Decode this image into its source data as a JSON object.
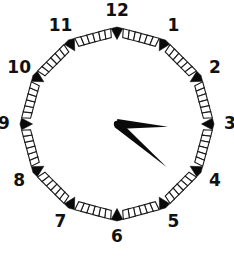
{
  "widget": {
    "type": "analog-clock",
    "title": "Analog clock face",
    "background_color": "#ffffff",
    "ink_color": "#0a0a0a",
    "dial_shape": "dodecagon",
    "dial_style": "segmented-ladder-ring",
    "marker_style": "solid-triangle-arrowhead"
  },
  "dial": {
    "center_x": 117,
    "center_y": 124,
    "radius": 97,
    "ring_thickness": 9,
    "number_radius": 113,
    "segments_per_side": 6,
    "hour_numbers": [
      {
        "label": "12",
        "hour": 12,
        "angle_deg": 0
      },
      {
        "label": "1",
        "hour": 1,
        "angle_deg": 30
      },
      {
        "label": "2",
        "hour": 2,
        "angle_deg": 60
      },
      {
        "label": "3",
        "hour": 3,
        "angle_deg": 90
      },
      {
        "label": "4",
        "hour": 4,
        "angle_deg": 120
      },
      {
        "label": "5",
        "hour": 5,
        "angle_deg": 150
      },
      {
        "label": "6",
        "hour": 6,
        "angle_deg": 180
      },
      {
        "label": "7",
        "hour": 7,
        "angle_deg": 210
      },
      {
        "label": "8",
        "hour": 8,
        "angle_deg": 240
      },
      {
        "label": "9",
        "hour": 9,
        "angle_deg": 270
      },
      {
        "label": "10",
        "hour": 10,
        "angle_deg": 300
      },
      {
        "label": "11",
        "hour": 11,
        "angle_deg": 330
      }
    ]
  },
  "hands": {
    "hour": {
      "name": "hour-hand",
      "angle_deg": 131,
      "length": 66,
      "base_half_width": 4,
      "points_toward": "between 4 and 5"
    },
    "minute": {
      "name": "minute-hand",
      "angle_deg": 93,
      "length": 51,
      "base_half_width": 5,
      "points_toward": "3"
    },
    "pivot_radius": 3.2
  },
  "time": {
    "hour": 4,
    "minute": 16,
    "reading": "4:16"
  }
}
